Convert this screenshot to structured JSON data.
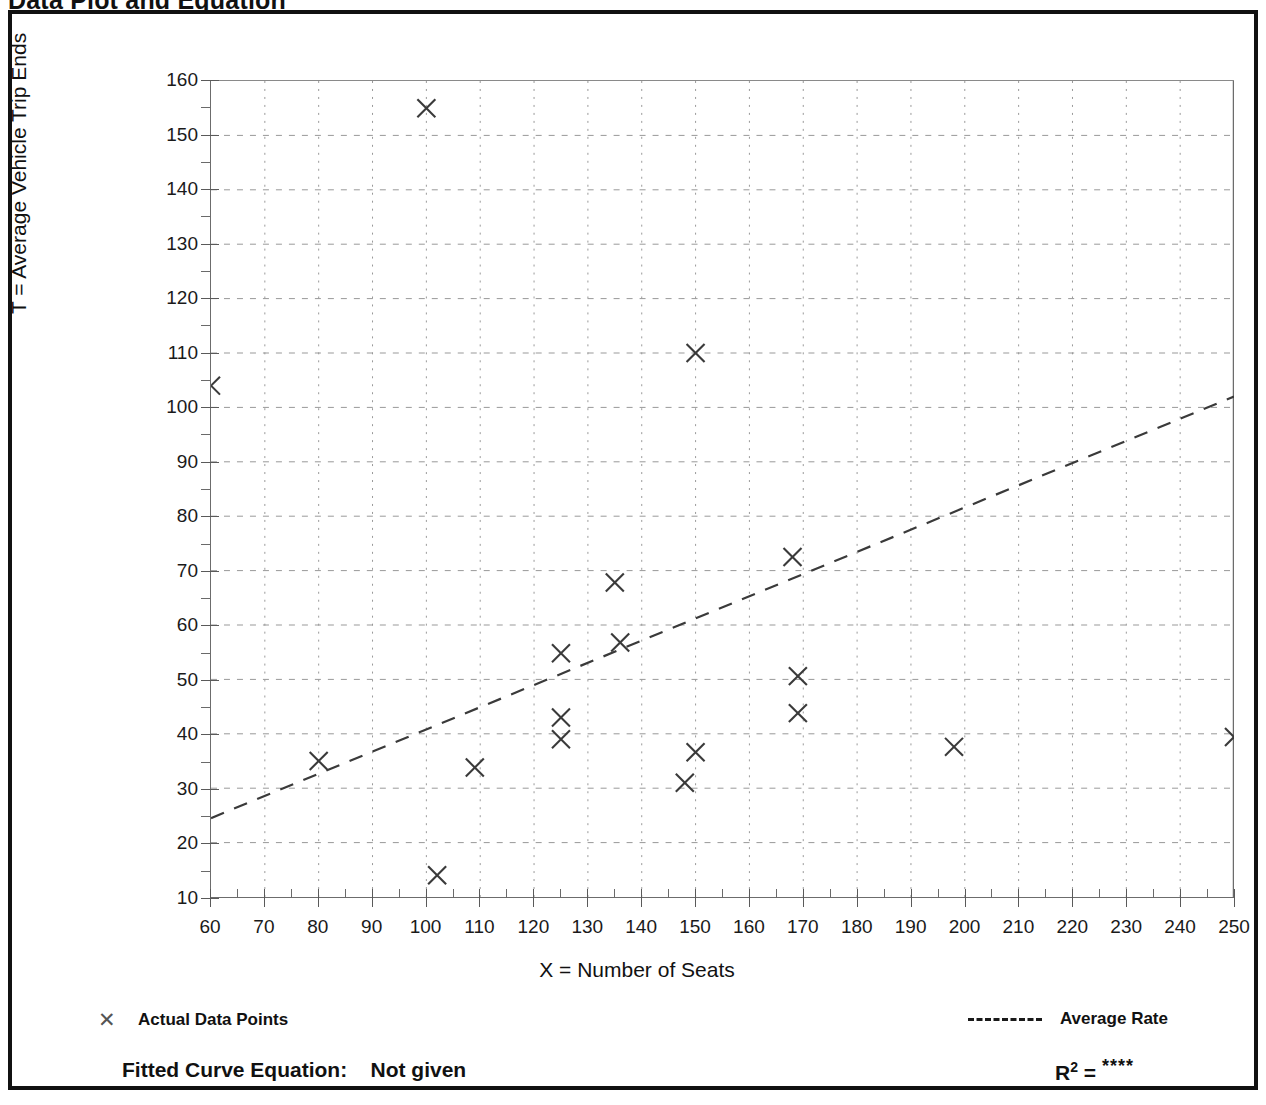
{
  "page": {
    "title": "Data Plot and Equation"
  },
  "axes": {
    "y_title": "T = Average Vehicle Trip Ends",
    "x_title": "X = Number of Seats",
    "y_ticks": [
      10,
      20,
      30,
      40,
      50,
      60,
      70,
      80,
      90,
      100,
      110,
      120,
      130,
      140,
      150,
      160
    ],
    "x_ticks": [
      60,
      70,
      80,
      90,
      100,
      110,
      120,
      130,
      140,
      150,
      160,
      170,
      180,
      190,
      200,
      210,
      220,
      230,
      240,
      250
    ]
  },
  "legend": {
    "data_points_label": "Actual Data Points",
    "data_points_marker": "x-marker-icon",
    "average_rate_label": "Average Rate",
    "average_rate_marker": "dashed-line-icon"
  },
  "footer": {
    "equation_label": "Fitted Curve Equation:",
    "equation_value": "Not given",
    "r2_label": "R",
    "r2_exponent": "2",
    "r2_equals": " = ",
    "r2_value": "****"
  },
  "colors": {
    "frame": "#111111",
    "axis": "#6c6c6c",
    "grid": "#999999",
    "marker": "#3a3a3a",
    "trendline": "#3a3a3a",
    "background": "#ffffff"
  },
  "chart_data": {
    "type": "scatter",
    "title": "Data Plot and Equation",
    "xlabel": "X = Number of Seats",
    "ylabel": "T = Average Vehicle Trip Ends",
    "xlim": [
      60,
      250
    ],
    "ylim": [
      10,
      160
    ],
    "grid": true,
    "legend_position": "below-axes",
    "series": [
      {
        "name": "Actual Data Points",
        "marker": "x",
        "points": [
          {
            "x": 60,
            "y": 104.0
          },
          {
            "x": 80,
            "y": 35.0
          },
          {
            "x": 100,
            "y": 155.0
          },
          {
            "x": 102,
            "y": 14.0
          },
          {
            "x": 109,
            "y": 33.8
          },
          {
            "x": 125,
            "y": 54.8
          },
          {
            "x": 125,
            "y": 43.0
          },
          {
            "x": 125,
            "y": 39.0
          },
          {
            "x": 135,
            "y": 67.8
          },
          {
            "x": 136,
            "y": 56.8
          },
          {
            "x": 148,
            "y": 31.0
          },
          {
            "x": 150,
            "y": 110.0
          },
          {
            "x": 150,
            "y": 36.6
          },
          {
            "x": 168,
            "y": 72.5
          },
          {
            "x": 169,
            "y": 50.6
          },
          {
            "x": 169,
            "y": 43.8
          },
          {
            "x": 198,
            "y": 37.6
          },
          {
            "x": 250,
            "y": 39.4
          }
        ]
      },
      {
        "name": "Average Rate",
        "type": "line",
        "style": "dashed",
        "endpoints": [
          {
            "x": 60,
            "y": 24.5
          },
          {
            "x": 250,
            "y": 102.0
          }
        ]
      }
    ]
  }
}
